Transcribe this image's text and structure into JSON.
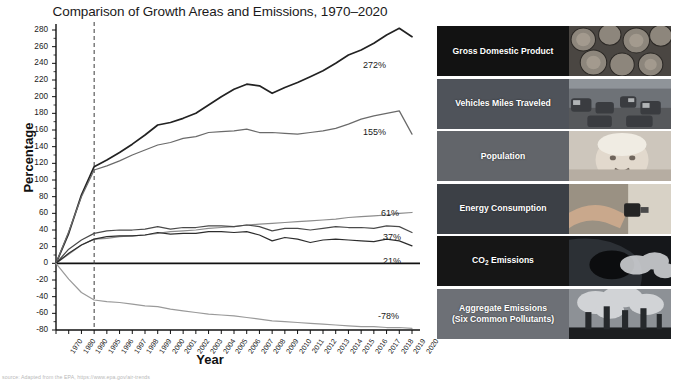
{
  "chart_data": {
    "type": "line",
    "title": "Comparison of Growth Areas and Emissions, 1970–2020",
    "xlabel": "Year",
    "ylabel": "Percentage",
    "ylim": [
      -80,
      280
    ],
    "ytick_step": 20,
    "grid": false,
    "legend_position": "right",
    "reference_line": {
      "x": "1995",
      "style": "dashed"
    },
    "categories": [
      "1970",
      "1980",
      "1990",
      "1995",
      "1996",
      "1997",
      "1998",
      "1999",
      "2000",
      "2001",
      "2002",
      "2003",
      "2004",
      "2005",
      "2006",
      "2007",
      "2008",
      "2009",
      "2010",
      "2011",
      "2012",
      "2013",
      "2014",
      "2015",
      "2016",
      "2017",
      "2018",
      "2019",
      "2020"
    ],
    "yticks": [
      "280",
      "260",
      "240",
      "220",
      "200",
      "180",
      "160",
      "140",
      "120",
      "100",
      "80",
      "60",
      "40",
      "20",
      "0",
      "-20",
      "-40",
      "-60",
      "-80"
    ],
    "series": [
      {
        "name": "Gross Domestic Product",
        "end_label": "272%",
        "color": "#222222",
        "values": [
          0,
          36,
          82,
          116,
          124,
          133,
          143,
          154,
          166,
          169,
          174,
          180,
          190,
          200,
          209,
          215,
          213,
          204,
          211,
          217,
          224,
          231,
          240,
          250,
          256,
          264,
          274,
          282,
          272
        ]
      },
      {
        "name": "Vehicles Miles Traveled",
        "end_label": "155%",
        "color": "#6a6a6a",
        "values": [
          0,
          38,
          80,
          112,
          117,
          123,
          130,
          136,
          142,
          145,
          150,
          152,
          157,
          158,
          159,
          161,
          157,
          157,
          156,
          155,
          157,
          159,
          162,
          167,
          173,
          177,
          180,
          183,
          155
        ]
      },
      {
        "name": "Population",
        "end_label": "61%",
        "color": "#8c8c8c",
        "values": [
          0,
          11,
          22,
          29,
          30,
          32,
          33,
          34,
          36,
          38,
          39,
          40,
          42,
          43,
          44,
          46,
          47,
          48,
          49,
          50,
          51,
          52,
          53,
          55,
          56,
          57,
          58,
          60,
          61
        ]
      },
      {
        "name": "Energy Consumption",
        "end_label": "37%",
        "color": "#4a4a4a",
        "values": [
          0,
          17,
          28,
          36,
          39,
          40,
          40,
          41,
          44,
          41,
          43,
          43,
          45,
          45,
          44,
          46,
          44,
          39,
          42,
          42,
          40,
          42,
          44,
          43,
          43,
          42,
          45,
          44,
          37
        ]
      },
      {
        "name": "CO₂ Emissions",
        "end_label": "21%",
        "color": "#2d2d2d",
        "values": [
          0,
          12,
          22,
          29,
          32,
          33,
          33,
          34,
          37,
          35,
          36,
          36,
          38,
          38,
          37,
          38,
          34,
          27,
          31,
          29,
          25,
          28,
          29,
          28,
          27,
          26,
          29,
          27,
          21
        ]
      },
      {
        "name": "Aggregate Emissions (Six Common Pollutants)",
        "end_label": "-78%",
        "color": "#9a9a9a",
        "values": [
          0,
          -19,
          -35,
          -44,
          -46,
          -47,
          -49,
          -51,
          -52,
          -55,
          -57,
          -59,
          -61,
          -62,
          -63,
          -65,
          -67,
          -69,
          -70,
          -71,
          -72,
          -73,
          -74,
          -75,
          -76,
          -76,
          -77,
          -77,
          -78
        ]
      }
    ]
  },
  "legend": {
    "items": [
      {
        "label": "Gross Domestic Product",
        "swatch_color": "#121212",
        "thumb": "coins-photo"
      },
      {
        "label": "Vehicles Miles Traveled",
        "swatch_color": "#4f535a",
        "thumb": "traffic-photo"
      },
      {
        "label": "Population",
        "swatch_color": "#62656a",
        "thumb": "baby-photo"
      },
      {
        "label": "Energy Consumption",
        "swatch_color": "#3c4046",
        "thumb": "plug-photo"
      },
      {
        "label": "CO2 Emissions",
        "label_main": "CO",
        "label_sub": "2",
        "label_rest": " Emissions",
        "swatch_color": "#161616",
        "thumb": "exhaust-photo"
      },
      {
        "label": "Aggregate Emissions (Six Common Pollutants)",
        "label_line1": "Aggregate Emissions",
        "label_line2": "(Six Common Pollutants)",
        "swatch_color": "#6d7076",
        "thumb": "smokestacks-photo"
      }
    ]
  },
  "footnote": {
    "text": "source: Adapted from the EPA, https://www.epa.gov/air-trends"
  }
}
